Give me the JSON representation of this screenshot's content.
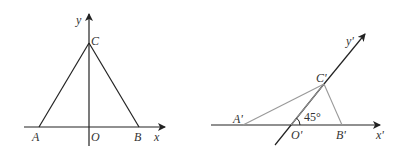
{
  "figure_left": {
    "title": "Original triangle in xOy coordinate system",
    "points": {
      "A": {
        "label": "A"
      },
      "B": {
        "label": "B"
      },
      "C": {
        "label": "C"
      },
      "O": {
        "label": "O"
      }
    },
    "axes": {
      "x_label": "x",
      "y_label": "y"
    }
  },
  "figure_right": {
    "title": "Oblique projection (intuitive drawing) in x'O'y' system",
    "points": {
      "A": {
        "label": "A'"
      },
      "B": {
        "label": "B'"
      },
      "C": {
        "label": "C'"
      },
      "O": {
        "label": "O'"
      }
    },
    "axes": {
      "x_label": "x'",
      "y_label": "y'"
    },
    "angle_label": "45°"
  },
  "colors": {
    "stroke_dark": "#222222",
    "stroke_light": "#999999"
  }
}
